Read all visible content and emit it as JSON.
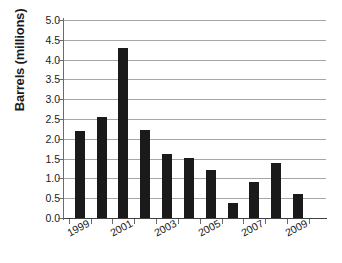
{
  "chart_data": {
    "type": "bar",
    "title": "",
    "subtitle": "",
    "xlabel": "",
    "ylabel": "Barrels (millions)",
    "categories": [
      "1998",
      "1999",
      "2000",
      "2001",
      "2002",
      "2003",
      "2004",
      "2005",
      "2006",
      "2007",
      "2008"
    ],
    "values": [
      2.2,
      2.55,
      4.3,
      2.22,
      1.62,
      1.52,
      1.22,
      0.39,
      0.92,
      1.39,
      0.61
    ],
    "ylim": [
      0,
      5
    ],
    "ytick_values": [
      0,
      0.5,
      1,
      1.5,
      2,
      2.5,
      3,
      3.5,
      4,
      4.5,
      5
    ],
    "ytick_labels": [
      "0.0",
      "0.5",
      "1.0",
      "1.5",
      "2.0",
      "2.5",
      "3.0",
      "3.5",
      "4.0",
      "4.5",
      "5.0"
    ],
    "xtick_labels": [
      "1999",
      "2001",
      "2003",
      "2005",
      "2007",
      "2009"
    ],
    "xtick_label_indices": [
      1,
      3,
      5,
      7,
      9,
      11
    ],
    "grid": "horizontal",
    "legend": "none",
    "bar_color": "#1a1a1a",
    "gridline_color": "#a6a6a6",
    "axis_color": "#3f3f3f",
    "background_color": "#ffffff"
  }
}
